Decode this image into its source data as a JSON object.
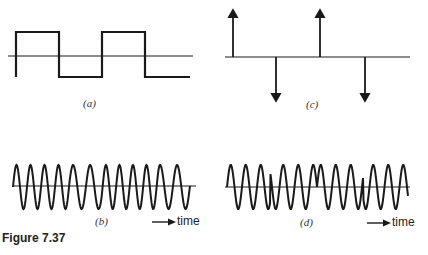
{
  "figure": {
    "caption": "Figure 7.37",
    "panels": [
      {
        "id": "a",
        "label": "(a)",
        "type": "square-wave"
      },
      {
        "id": "b",
        "label": "(b)",
        "type": "frequency-shift-sinusoid"
      },
      {
        "id": "c",
        "label": "(c)",
        "type": "impulse-train"
      },
      {
        "id": "d",
        "label": "(d)",
        "type": "phase-shift-sinusoid"
      }
    ],
    "time_axis_label_b": "time",
    "time_axis_label_d": "time",
    "stroke_color": "#1a1a1a"
  }
}
